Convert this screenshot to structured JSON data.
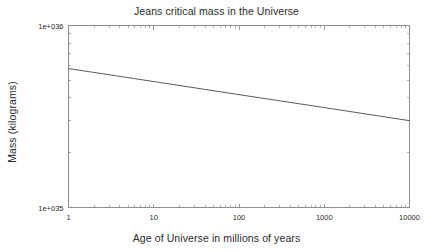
{
  "chart_data": {
    "type": "line",
    "title": "Jeans critical mass in the Universe",
    "xlabel": "Age of Universe in millions of years",
    "ylabel": "Mass (kilograms)",
    "xscale": "log",
    "yscale": "log",
    "xlim": [
      1,
      10000
    ],
    "ylim": [
      1e+35,
      1e+36
    ],
    "grid": false,
    "legend": null,
    "xticks": [
      1,
      10,
      100,
      1000,
      10000
    ],
    "xtick_labels": [
      "1",
      "10",
      "100",
      "1000",
      "10000"
    ],
    "yticks": [
      1e+35,
      1e+36
    ],
    "ytick_labels": [
      "1e+035",
      "1e+036"
    ],
    "series": [
      {
        "name": "Jeans critical mass",
        "x": [
          1,
          10,
          100,
          1000,
          10000
        ],
        "y": [
          5.8e+35,
          4.92e+35,
          4.17e+35,
          3.54e+35,
          3e+35
        ]
      }
    ],
    "annotations": []
  },
  "style": {
    "background": "#ffffff",
    "axis_color": "#8c8c8c",
    "line_color": "#5a5a5a",
    "text_color": "#2b2b2b"
  }
}
